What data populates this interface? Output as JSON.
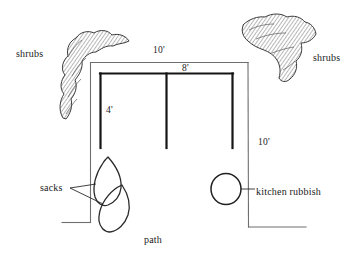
{
  "diagram": {
    "type": "hand-drawn-garden-plan",
    "labels": {
      "shrubs_left": "shrubs",
      "shrubs_right": "shrubs",
      "dim_top_outer": "10'",
      "dim_top_inner": "8'",
      "dim_left_inner": "4'",
      "dim_right_outer": "10'",
      "sacks": "sacks",
      "kitchen_rubbish": "kitchen rubbish",
      "path": "path"
    },
    "colors": {
      "ink": "#1a1a1a",
      "thin_line": "#6e6e6e",
      "hatch": "#8a8a8a",
      "background": "#ffffff"
    },
    "elements": [
      {
        "name": "outer-boundary",
        "label": "10'"
      },
      {
        "name": "compost-bays",
        "label": "8'"
      },
      {
        "name": "bay-depth",
        "label": "4'"
      },
      {
        "name": "shrub-clump-left",
        "label": "shrubs"
      },
      {
        "name": "shrub-clump-right",
        "label": "shrubs"
      },
      {
        "name": "sack-upper",
        "label": "sacks"
      },
      {
        "name": "sack-lower",
        "label": "sacks"
      },
      {
        "name": "rubbish-bin",
        "label": "kitchen rubbish"
      },
      {
        "name": "path-area",
        "label": "path"
      }
    ]
  }
}
